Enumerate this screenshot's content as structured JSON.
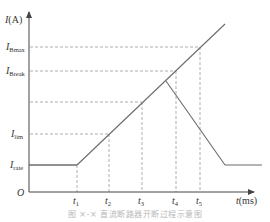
{
  "figure": {
    "y_axis_label": {
      "symbol": "I",
      "unit": "(A)"
    },
    "x_axis_label": {
      "symbol": "t",
      "unit": "(ms)"
    },
    "origin_label": "O",
    "y_levels": [
      {
        "key": "I_Bmax",
        "symbol": "I",
        "sub": "Bmax"
      },
      {
        "key": "I_Break",
        "symbol": "I",
        "sub": "Break"
      },
      {
        "key": "unlabeled",
        "symbol": "",
        "sub": ""
      },
      {
        "key": "I_lim",
        "symbol": "I",
        "sub": "lim"
      },
      {
        "key": "I_rate",
        "symbol": "I",
        "sub": "rate"
      }
    ],
    "x_ticks": [
      {
        "symbol": "t",
        "sub": "1"
      },
      {
        "symbol": "t",
        "sub": "2"
      },
      {
        "symbol": "t",
        "sub": "3"
      },
      {
        "symbol": "t",
        "sub": "4"
      },
      {
        "symbol": "t",
        "sub": "5"
      }
    ],
    "caption": "图 ×-× 直流断路器开断过程示意图",
    "colors": {
      "curve": "#6b6b6b",
      "axis": "#555555",
      "dashed": "#9a9a9a",
      "text": "#333333"
    }
  }
}
